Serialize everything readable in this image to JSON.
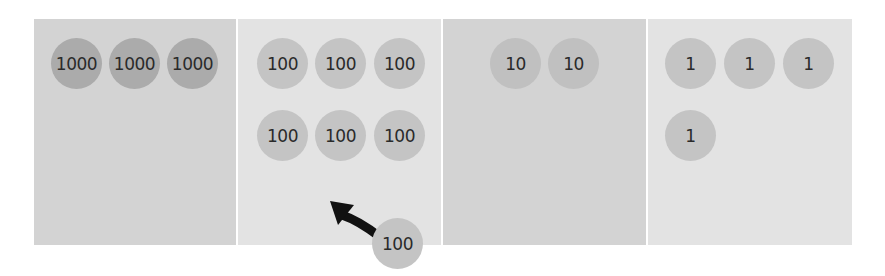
{
  "diagram": {
    "colors": {
      "col_dark_bg": "#d3d3d3",
      "col_light_bg": "#e3e3e3",
      "circle_dark": "#ababab",
      "circle_light": "#c4c4c4",
      "text": "#2a2a2a",
      "arrow": "#111111"
    },
    "columns": [
      {
        "place": "thousands",
        "bg": "dark",
        "circles": [
          "1000",
          "1000",
          "1000"
        ]
      },
      {
        "place": "hundreds",
        "bg": "light",
        "circles": [
          "100",
          "100",
          "100",
          "100",
          "100",
          "100"
        ]
      },
      {
        "place": "tens",
        "bg": "dark",
        "circles": [
          "10",
          "10"
        ]
      },
      {
        "place": "ones",
        "bg": "light",
        "circles": [
          "1",
          "1",
          "1",
          "1"
        ]
      }
    ],
    "moving_circle": {
      "label": "100",
      "target_column": "hundreds"
    },
    "arrow_icon": "curved-arrow-up-left"
  }
}
